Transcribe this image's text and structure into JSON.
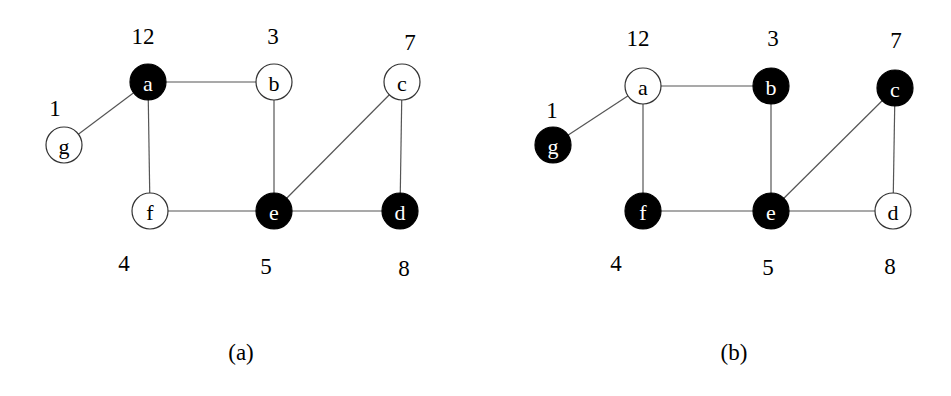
{
  "figures": [
    {
      "id": "a",
      "caption": "(a)",
      "caption_pos": [
        241,
        352
      ],
      "nodes": [
        {
          "label": "a",
          "x": 148,
          "y": 82,
          "filled": true,
          "weight": "12",
          "wx": 143,
          "wy": 36
        },
        {
          "label": "b",
          "x": 274,
          "y": 82,
          "filled": false,
          "weight": "3",
          "wx": 273,
          "wy": 36
        },
        {
          "label": "c",
          "x": 402,
          "y": 82,
          "filled": false,
          "weight": "7",
          "wx": 410,
          "wy": 42
        },
        {
          "label": "g",
          "x": 64,
          "y": 145,
          "filled": false,
          "weight": "1",
          "wx": 55,
          "wy": 108
        },
        {
          "label": "f",
          "x": 150,
          "y": 211,
          "filled": false,
          "weight": "4",
          "wx": 124,
          "wy": 263
        },
        {
          "label": "e",
          "x": 274,
          "y": 211,
          "filled": true,
          "weight": "5",
          "wx": 266,
          "wy": 266
        },
        {
          "label": "d",
          "x": 400,
          "y": 211,
          "filled": true,
          "weight": "8",
          "wx": 404,
          "wy": 268
        }
      ],
      "edges": [
        [
          "g",
          "a"
        ],
        [
          "a",
          "b"
        ],
        [
          "a",
          "f"
        ],
        [
          "b",
          "e"
        ],
        [
          "f",
          "e"
        ],
        [
          "e",
          "c"
        ],
        [
          "e",
          "d"
        ],
        [
          "c",
          "d"
        ]
      ]
    },
    {
      "id": "b",
      "caption": "(b)",
      "caption_pos": [
        734,
        352
      ],
      "nodes": [
        {
          "label": "a",
          "x": 643,
          "y": 86,
          "filled": false,
          "weight": "12",
          "wx": 638,
          "wy": 38
        },
        {
          "label": "b",
          "x": 771,
          "y": 86,
          "filled": true,
          "weight": "3",
          "wx": 773,
          "wy": 38
        },
        {
          "label": "c",
          "x": 895,
          "y": 88,
          "filled": true,
          "weight": "7",
          "wx": 896,
          "wy": 40
        },
        {
          "label": "g",
          "x": 553,
          "y": 145,
          "filled": true,
          "weight": "1",
          "wx": 552,
          "wy": 110
        },
        {
          "label": "f",
          "x": 643,
          "y": 211,
          "filled": true,
          "weight": "4",
          "wx": 616,
          "wy": 263
        },
        {
          "label": "e",
          "x": 771,
          "y": 211,
          "filled": true,
          "weight": "5",
          "wx": 768,
          "wy": 267
        },
        {
          "label": "d",
          "x": 893,
          "y": 211,
          "filled": false,
          "weight": "8",
          "wx": 890,
          "wy": 266
        }
      ],
      "edges": [
        [
          "g",
          "a"
        ],
        [
          "a",
          "b"
        ],
        [
          "a",
          "f"
        ],
        [
          "b",
          "e"
        ],
        [
          "f",
          "e"
        ],
        [
          "e",
          "c"
        ],
        [
          "e",
          "d"
        ],
        [
          "c",
          "d"
        ]
      ]
    }
  ],
  "node_radius": 18
}
